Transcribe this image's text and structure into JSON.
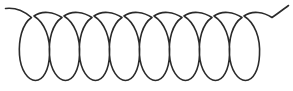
{
  "figure": {
    "type": "line-drawing",
    "background_color": "#ffffff",
    "stroke_color": "#2b2b2b",
    "stroke_width": 1.6,
    "canvas": {
      "width": 293,
      "height": 91
    }
  },
  "chart_data": {
    "type": "line",
    "xlabel": "",
    "ylabel": "",
    "grid": false,
    "legend": null,
    "xlim": [
      0,
      293
    ],
    "ylim": [
      0,
      91
    ],
    "geometry": {
      "loop_count": 7,
      "pitch_px": 40,
      "loop_width_px": 28,
      "loop_top_y_px": 13,
      "loop_bottom_y_px": 80,
      "crossing_y_px": 17,
      "first_loop_left_x_px": 20,
      "first_crossing_x_px": 32,
      "last_crossing_x_px": 272,
      "left_tail_start": [
        5,
        8
      ],
      "right_tail_end": [
        288,
        5
      ]
    },
    "loops": [
      {
        "index": 1,
        "center_x": 34,
        "left_x": 20,
        "right_x": 48,
        "top_y": 13,
        "bottom_y": 80
      },
      {
        "index": 2,
        "center_x": 74,
        "left_x": 60,
        "right_x": 88,
        "top_y": 13,
        "bottom_y": 80
      },
      {
        "index": 3,
        "center_x": 114,
        "left_x": 100,
        "right_x": 128,
        "top_y": 13,
        "bottom_y": 80
      },
      {
        "index": 4,
        "center_x": 154,
        "left_x": 140,
        "right_x": 168,
        "top_y": 13,
        "bottom_y": 80
      },
      {
        "index": 5,
        "center_x": 194,
        "left_x": 180,
        "right_x": 208,
        "top_y": 13,
        "bottom_y": 80
      },
      {
        "index": 6,
        "center_x": 234,
        "left_x": 220,
        "right_x": 248,
        "top_y": 13,
        "bottom_y": 80
      },
      {
        "index": 7,
        "center_x": 274,
        "left_x": 260,
        "right_x": 288,
        "top_y": 13,
        "bottom_y": 80
      }
    ],
    "paths": {
      "main_coil": "M 5.5 8.5 C 14 7.5 24 11 31.5 17.5 C 22 24 18.5 40 19.5 55 C 20.5 70 28 80.5 35.5 80.5 C 43 80.5 49 70 49.5 55 C 50.5 38 45 23 34 16 C 42 10 54 12 62 17.5 C 52 24 48.5 40 49.5 55 C 50.5 70 58 80.5 65.5 80.5 C 73 80.5 79 70 79.5 55 C 80.5 38 75 23 64 16 C 72 10 84 12 92 17.5 C 82 24 78.5 40 79.5 55 C 80.5 70 88 80.5 95.5 80.5 C 103 80.5 109 70 109.5 55 C 110.5 38 105 23 94 16 C 102 10 114 12 122 17.5 C 112 24 108.5 40 109.5 55 C 110.5 70 118 80.5 125.5 80.5 C 133 80.5 139 70 139.5 55 C 140.5 38 135 23 124 16 C 132 10 144 12 152 17.5 C 142 24 138.5 40 139.5 55 C 140.5 70 148 80.5 155.5 80.5 C 163 80.5 169 70 169.5 55 C 170.5 38 165 23 154 16 C 162 10 174 12 182 17.5 C 172 24 168.5 40 169.5 55 C 170.5 70 178 80.5 185.5 80.5 C 193 80.5 199 70 199.5 55 C 200.5 38 195 23 184 16 C 192 10 204 12 212 17.5 C 202 24 198.5 40 199.5 55 C 200.5 70 208 80.5 215.5 80.5 C 223 80.5 229 70 229.5 55 C 230.5 38 225 23 214 16 C 222 10 234 12 242 17.5 C 232 24 228.5 40 229.5 55 C 230.5 70 238 80.5 245.5 80.5 C 253 80.5 259 70 259.5 55 C 260.5 38 255 23 244 16 C 252 10 264 12 272 17.5 C 280 12 285 8 288.5 5.5"
    },
    "annotations": []
  }
}
